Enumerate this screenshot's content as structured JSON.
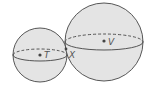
{
  "diagram": {
    "type": "tangent-spheres",
    "colors": {
      "fill": "#e4e4e4",
      "stroke": "#444444",
      "label": "#555555"
    },
    "spheres": [
      {
        "name": "small",
        "center_label": "T",
        "cx": 40,
        "cy": 55,
        "r": 27,
        "equator_ry": 6
      },
      {
        "name": "large",
        "center_label": "V",
        "cx": 104,
        "cy": 42,
        "r": 39,
        "equator_ry": 8
      }
    ],
    "tangent_point": {
      "label": "X",
      "x": 66,
      "y": 52
    },
    "labels": {
      "T": "T",
      "V": "V",
      "X": "X"
    }
  }
}
